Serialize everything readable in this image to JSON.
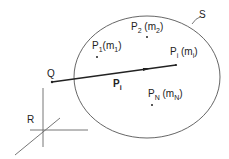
{
  "diagram": {
    "title": "",
    "region_label": "S",
    "reference_frame_label": "R",
    "origin_point_label": "Q",
    "vector_label": {
      "main": "P",
      "sub": "i"
    },
    "points": [
      {
        "name": "P",
        "sub": "1",
        "mass": "m",
        "mass_sub": "1"
      },
      {
        "name": "P",
        "sub": "2",
        "mass": "m",
        "mass_sub": "2"
      },
      {
        "name": "P",
        "sub": "i",
        "mass": "m",
        "mass_sub": "i"
      },
      {
        "name": "P",
        "sub": "N",
        "mass": "m",
        "mass_sub": "N"
      }
    ],
    "colors": {
      "line": "#333333",
      "ellipse": "#555555",
      "axes": "#666666"
    }
  }
}
